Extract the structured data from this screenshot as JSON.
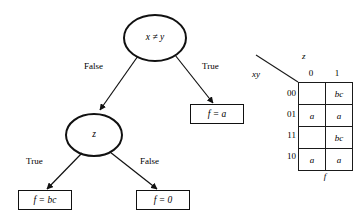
{
  "diagram": {
    "type": "binary-decision-tree",
    "nodes": [
      {
        "id": "root",
        "label": "x ≠ y",
        "shape": "ellipse",
        "cx": 155,
        "cy": 38,
        "rx": 31,
        "ry": 23
      },
      {
        "id": "znode",
        "label": "z",
        "shape": "ellipse",
        "cx": 94,
        "cy": 135,
        "rx": 28,
        "ry": 21
      }
    ],
    "edges": [
      {
        "id": "root-false",
        "from": "root",
        "to": "znode",
        "label": "False"
      },
      {
        "id": "root-true",
        "from": "root",
        "to": "leaf-f-a",
        "label": "True"
      },
      {
        "id": "z-true",
        "from": "znode",
        "to": "leaf-f-bc",
        "label": "True"
      },
      {
        "id": "z-false",
        "from": "znode",
        "to": "leaf-f-0",
        "label": "False"
      }
    ],
    "leaves": [
      {
        "id": "leaf-f-a",
        "label": "f = a"
      },
      {
        "id": "leaf-f-bc",
        "label": "f = bc"
      },
      {
        "id": "leaf-f-0",
        "label": "f = 0"
      }
    ]
  },
  "kmap": {
    "row_axis_label": "xy",
    "col_axis_label": "z",
    "function_label": "f",
    "col_headers": [
      "0",
      "1"
    ],
    "row_headers": [
      "00",
      "01",
      "11",
      "10"
    ],
    "cells": [
      [
        "",
        "bc"
      ],
      [
        "a",
        "a"
      ],
      [
        "",
        "bc"
      ],
      [
        "a",
        "a"
      ]
    ]
  }
}
